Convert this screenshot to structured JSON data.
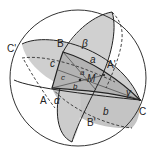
{
  "diagram": {
    "colors": {
      "background": "#ffffff",
      "sphere_outline": "#333333",
      "fill_light": "#d4d4d4",
      "fill_mid": "#bdbdbd",
      "fill_dark": "#a8a8a8",
      "line": "#222222"
    },
    "vertices": {
      "A": "A",
      "B": "B",
      "C": "C",
      "A_prime": "A'",
      "B_prime": "B'",
      "C_prime": "C'",
      "M": "M"
    },
    "angles": {
      "alpha": "α",
      "beta": "β",
      "gamma": "γ"
    },
    "sides": {
      "a_outer": "a",
      "b_outer": "b",
      "c_outer": "c",
      "a_inner": "a",
      "b_inner": "b",
      "c_inner": "c"
    }
  }
}
